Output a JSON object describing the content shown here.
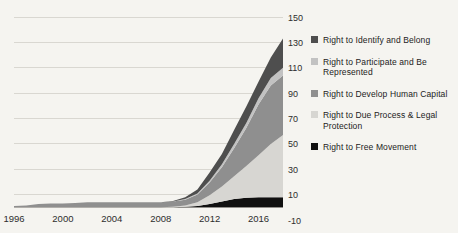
{
  "chart_data": {
    "type": "area",
    "stacked": true,
    "title": "",
    "xlabel": "",
    "ylabel": "",
    "x": [
      1996,
      1997,
      1998,
      1999,
      2000,
      2001,
      2002,
      2003,
      2004,
      2005,
      2006,
      2007,
      2008,
      2009,
      2010,
      2011,
      2012,
      2013,
      2014,
      2015,
      2016,
      2017,
      2018
    ],
    "xticks": [
      1996,
      2000,
      2004,
      2008,
      2012,
      2016
    ],
    "yticks": [
      150,
      130,
      110,
      90,
      70,
      50,
      30,
      10,
      -10
    ],
    "ylim": [
      -10,
      150
    ],
    "xlim": [
      1996,
      2018
    ],
    "grid": true,
    "legend_position": "right",
    "series": [
      {
        "name": "Right to Free Movement",
        "color": "#101010",
        "values": [
          0,
          0,
          0,
          0,
          0,
          0,
          0,
          0,
          0,
          0,
          0,
          0,
          0,
          0,
          0.5,
          1,
          2.5,
          4.5,
          6.5,
          7.5,
          8,
          8,
          8
        ]
      },
      {
        "name": "Right to Due Process & Legal Protection",
        "color": "#d7d6d2",
        "values": [
          0,
          0,
          0,
          0,
          0,
          0,
          0,
          0,
          0,
          0,
          0,
          0,
          0,
          0.5,
          1,
          3,
          7,
          12,
          18,
          25,
          33,
          42,
          49
        ]
      },
      {
        "name": "Right to Develop Human Capital",
        "color": "#8f8f8f",
        "values": [
          1,
          1.5,
          2.5,
          3,
          3,
          3.5,
          4,
          4,
          4,
          4,
          4,
          4,
          4,
          4,
          4.5,
          6,
          10,
          15,
          22,
          30,
          40,
          46,
          47
        ]
      },
      {
        "name": "Right to Participate and Be Represented",
        "color": "#c2c2c2",
        "values": [
          0,
          0,
          0,
          0,
          0,
          0,
          0,
          0,
          0,
          0,
          0,
          0,
          0,
          0,
          0.5,
          1,
          1.5,
          2.5,
          3.5,
          4,
          5,
          6,
          6
        ]
      },
      {
        "name": "Right to Identify and Belong",
        "color": "#4e4e4e",
        "values": [
          0,
          0,
          0,
          0,
          0,
          0,
          0,
          0,
          0,
          0,
          0,
          0,
          0,
          0.5,
          1.5,
          3,
          6.5,
          8,
          11,
          13,
          13,
          16,
          23
        ]
      }
    ],
    "legend": [
      {
        "label": "Right to Identify and Belong",
        "color": "#4e4e4e"
      },
      {
        "label": "Right to Participate and Be Represented",
        "color": "#c2c2c2"
      },
      {
        "label": "Right to Develop Human Capital",
        "color": "#8f8f8f"
      },
      {
        "label": "Right to Due Process & Legal Protection",
        "color": "#d7d6d2"
      },
      {
        "label": "Right to Free Movement",
        "color": "#101010"
      }
    ],
    "colors": {
      "background": "#f5f4f0",
      "gridline": "#d9d7d1",
      "axis_line": "#bcbab4",
      "tick_text": "#2d2d2d"
    }
  }
}
